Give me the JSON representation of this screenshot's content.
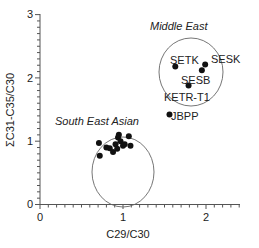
{
  "chart_data": {
    "type": "scatter",
    "title": "",
    "xlabel": "C29/C30",
    "ylabel": "ΣC31-C35/C30",
    "xlim": [
      0,
      2.4
    ],
    "ylim": [
      0,
      3
    ],
    "x_ticks": [
      "0",
      "1",
      "2"
    ],
    "y_ticks": [
      "0",
      "1",
      "2",
      "3"
    ],
    "grid": false,
    "legend": null,
    "groups": [
      {
        "name": "South East Asian",
        "points": [
          {
            "x": 0.71,
            "y": 0.97
          },
          {
            "x": 0.72,
            "y": 0.77
          },
          {
            "x": 0.8,
            "y": 0.9
          },
          {
            "x": 0.84,
            "y": 0.89
          },
          {
            "x": 0.88,
            "y": 0.83
          },
          {
            "x": 0.91,
            "y": 0.95
          },
          {
            "x": 0.93,
            "y": 0.88
          },
          {
            "x": 0.94,
            "y": 1.06
          },
          {
            "x": 0.95,
            "y": 1.1
          },
          {
            "x": 0.97,
            "y": 1.0
          },
          {
            "x": 1.0,
            "y": 0.93
          },
          {
            "x": 1.02,
            "y": 0.95
          },
          {
            "x": 1.07,
            "y": 1.08
          },
          {
            "x": 1.09,
            "y": 0.93
          }
        ],
        "ellipse": {
          "cx": 1.0,
          "cy": 0.75,
          "rx": 0.37,
          "ry": 0.55
        }
      },
      {
        "name": "Middle East",
        "points": [
          {
            "label": "SETK",
            "x": 1.63,
            "y": 2.18
          },
          {
            "label": "SESK",
            "x": 1.99,
            "y": 2.21
          },
          {
            "label": "SESB",
            "x": 1.95,
            "y": 2.12
          },
          {
            "label": "KETR-T1",
            "x": 1.79,
            "y": 1.88
          }
        ],
        "ellipse": {
          "cx": 1.82,
          "cy": 2.08,
          "rx": 0.38,
          "ry": 0.52
        }
      },
      {
        "name": "Outlier",
        "points": [
          {
            "label": "JBPP",
            "x": 1.56,
            "y": 1.42
          }
        ]
      }
    ],
    "annotations": [
      "Middle East",
      "South East Asian",
      "SETK",
      "SESK",
      "SESB",
      "KETR-T1",
      "JBPP"
    ]
  },
  "labels": {
    "xlabel": "C29/C30",
    "ylabel": "ΣC31-C35/C30",
    "group_se_asian": "South East Asian",
    "group_middle_east": "Middle East",
    "x0": "0",
    "x1": "1",
    "x2": "2",
    "y0": "0",
    "y1": "1",
    "y2": "2",
    "y3": "3",
    "pt_setk": "SETK",
    "pt_sesk": "SESK",
    "pt_sesb": "SESB",
    "pt_ketr": "KETR-T1",
    "pt_jbpp": "JBPP"
  }
}
